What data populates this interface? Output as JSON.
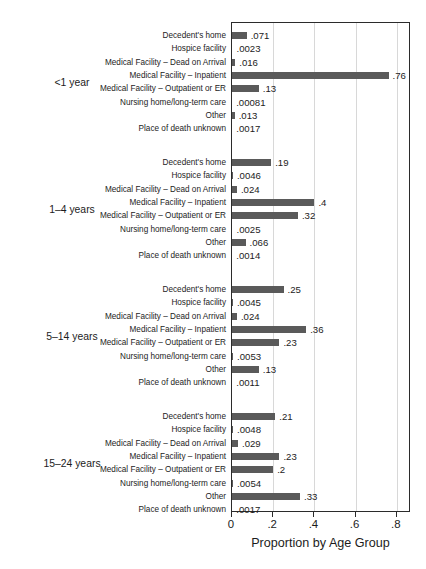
{
  "chart_data": {
    "type": "bar",
    "orientation": "horizontal",
    "title": "",
    "xlabel": "Proportion by Age Group",
    "ylabel": "",
    "xlim": [
      0,
      0.87
    ],
    "xticks": [
      0,
      0.2,
      0.4,
      0.6,
      0.8
    ],
    "xticklabels": [
      "0",
      ".2",
      ".4",
      ".6",
      ".8"
    ],
    "grid": "vertical",
    "legend": "none",
    "bar_color": "#5a5a5a",
    "categories": [
      "Decedent's home",
      "Hospice facility",
      "Medical Facility – Dead on Arrival",
      "Medical Facility – Inpatient",
      "Medical Facility – Outpatient or ER",
      "Nursing home/long-term care",
      "Other",
      "Place of death unknown"
    ],
    "groups": [
      {
        "label": "<1 year",
        "values": [
          0.071,
          0.0023,
          0.016,
          0.76,
          0.13,
          0.00081,
          0.013,
          0.0017
        ],
        "value_labels": [
          ".071",
          ".0023",
          ".016",
          ".76",
          ".13",
          ".00081",
          ".013",
          ".0017"
        ]
      },
      {
        "label": "1–4 years",
        "values": [
          0.19,
          0.0046,
          0.024,
          0.4,
          0.32,
          0.0025,
          0.066,
          0.0014
        ],
        "value_labels": [
          ".19",
          ".0046",
          ".024",
          ".4",
          ".32",
          ".0025",
          ".066",
          ".0014"
        ]
      },
      {
        "label": "5–14 years",
        "values": [
          0.25,
          0.0045,
          0.024,
          0.36,
          0.23,
          0.0053,
          0.13,
          0.0011
        ],
        "value_labels": [
          ".25",
          ".0045",
          ".024",
          ".36",
          ".23",
          ".0053",
          ".13",
          ".0011"
        ]
      },
      {
        "label": "15–24 years",
        "values": [
          0.21,
          0.0048,
          0.029,
          0.23,
          0.2,
          0.0054,
          0.33,
          0.0017
        ],
        "value_labels": [
          ".21",
          ".0048",
          ".029",
          ".23",
          ".2",
          ".0054",
          ".33",
          ".0017"
        ]
      }
    ]
  }
}
